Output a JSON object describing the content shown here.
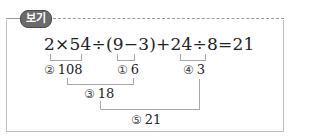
{
  "header": {
    "badge_label": "보기"
  },
  "expression": "2×54÷(9−3)+24÷8=21",
  "steps": [
    {
      "marker": "②",
      "value": "108"
    },
    {
      "marker": "①",
      "value": "6"
    },
    {
      "marker": "④",
      "value": "3"
    },
    {
      "marker": "③",
      "value": "18"
    },
    {
      "marker": "⑤",
      "value": "21"
    }
  ],
  "colors": {
    "badge_bg": "#6b6b6b",
    "border": "#bdbdbd",
    "bracket": "#a8a8a8"
  }
}
